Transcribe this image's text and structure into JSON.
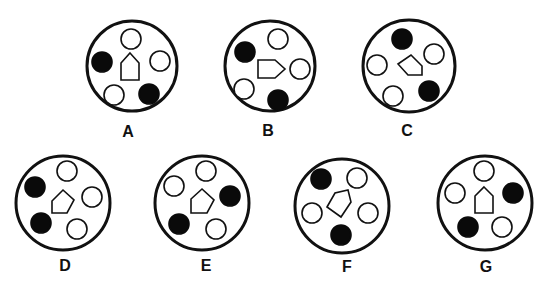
{
  "puzzle": {
    "colors": {
      "stroke": "#111111",
      "fill_dark": "#0a0a0a",
      "background": "#ffffff"
    },
    "dot_radius": 10,
    "options": [
      {
        "label": "A",
        "center": [
          132,
          66
        ],
        "radius": 45,
        "label_pos": [
          128,
          133
        ],
        "dots": [
          {
            "pos": [
              131,
              39
            ],
            "filled": false
          },
          {
            "pos": [
              102,
              62
            ],
            "filled": true
          },
          {
            "pos": [
              160,
              61
            ],
            "filled": false
          },
          {
            "pos": [
              114,
              95
            ],
            "filled": false
          },
          {
            "pos": [
              149,
              94
            ],
            "filled": true
          }
        ],
        "pentagon": [
          [
            130,
            53
          ],
          [
            139,
            63
          ],
          [
            139,
            80
          ],
          [
            121,
            80
          ],
          [
            121,
            63
          ]
        ]
      },
      {
        "label": "B",
        "center": [
          270,
          66
        ],
        "radius": 45,
        "label_pos": [
          268,
          132
        ],
        "dots": [
          {
            "pos": [
              278,
              39
            ],
            "filled": false
          },
          {
            "pos": [
              245,
              52
            ],
            "filled": true
          },
          {
            "pos": [
              300,
              69
            ],
            "filled": false
          },
          {
            "pos": [
              244,
              89
            ],
            "filled": false
          },
          {
            "pos": [
              278,
              100
            ],
            "filled": true
          }
        ],
        "pentagon": [
          [
            258,
            60
          ],
          [
            275,
            60
          ],
          [
            285,
            69
          ],
          [
            275,
            78
          ],
          [
            258,
            78
          ]
        ]
      },
      {
        "label": "C",
        "center": [
          409,
          66
        ],
        "radius": 46,
        "label_pos": [
          407,
          132
        ],
        "dots": [
          {
            "pos": [
              402,
              39
            ],
            "filled": true
          },
          {
            "pos": [
              434,
              54
            ],
            "filled": false
          },
          {
            "pos": [
              377,
              65
            ],
            "filled": false
          },
          {
            "pos": [
              393,
              96
            ],
            "filled": false
          },
          {
            "pos": [
              429,
              91
            ],
            "filled": true
          }
        ],
        "pentagon": [
          [
            398,
            64
          ],
          [
            411,
            55
          ],
          [
            422,
            66
          ],
          [
            422,
            75
          ],
          [
            408,
            75
          ]
        ]
      },
      {
        "label": "D",
        "center": [
          63,
          203
        ],
        "radius": 47,
        "label_pos": [
          65,
          267
        ],
        "dots": [
          {
            "pos": [
              67,
              171
            ],
            "filled": false
          },
          {
            "pos": [
              35,
              187
            ],
            "filled": true
          },
          {
            "pos": [
              92,
              197
            ],
            "filled": false
          },
          {
            "pos": [
              41,
              223
            ],
            "filled": true
          },
          {
            "pos": [
              77,
              229
            ],
            "filled": false
          }
        ],
        "pentagon": [
          [
            52,
            201
          ],
          [
            63,
            190
          ],
          [
            74,
            200
          ],
          [
            67,
            213
          ],
          [
            52,
            213
          ]
        ]
      },
      {
        "label": "E",
        "center": [
          202,
          203
        ],
        "radius": 47,
        "label_pos": [
          206,
          267
        ],
        "dots": [
          {
            "pos": [
              206,
              171
            ],
            "filled": false
          },
          {
            "pos": [
              174,
              186
            ],
            "filled": false
          },
          {
            "pos": [
              230,
              196
            ],
            "filled": true
          },
          {
            "pos": [
              179,
              224
            ],
            "filled": true
          },
          {
            "pos": [
              216,
              229
            ],
            "filled": false
          }
        ],
        "pentagon": [
          [
            191,
            199
          ],
          [
            202,
            189
          ],
          [
            214,
            200
          ],
          [
            207,
            213
          ],
          [
            191,
            213
          ]
        ]
      },
      {
        "label": "F",
        "center": [
          342,
          206
        ],
        "radius": 47,
        "label_pos": [
          347,
          268
        ],
        "dots": [
          {
            "pos": [
              321,
              179
            ],
            "filled": true
          },
          {
            "pos": [
              357,
              178
            ],
            "filled": false
          },
          {
            "pos": [
              312,
              213
            ],
            "filled": false
          },
          {
            "pos": [
              368,
              213
            ],
            "filled": false
          },
          {
            "pos": [
              341,
              235
            ],
            "filled": true
          }
        ],
        "pentagon": [
          [
            327,
            207
          ],
          [
            335,
            193
          ],
          [
            348,
            190
          ],
          [
            351,
            202
          ],
          [
            341,
            217
          ]
        ]
      },
      {
        "label": "G",
        "center": [
          485,
          203
        ],
        "radius": 47,
        "label_pos": [
          486,
          268
        ],
        "dots": [
          {
            "pos": [
              484,
              171
            ],
            "filled": false
          },
          {
            "pos": [
              455,
              193
            ],
            "filled": false
          },
          {
            "pos": [
              513,
              193
            ],
            "filled": true
          },
          {
            "pos": [
              468,
              227
            ],
            "filled": true
          },
          {
            "pos": [
              502,
              227
            ],
            "filled": false
          }
        ],
        "pentagon": [
          [
            484,
            187
          ],
          [
            493,
            196
          ],
          [
            493,
            213
          ],
          [
            475,
            213
          ],
          [
            475,
            196
          ]
        ]
      }
    ]
  }
}
